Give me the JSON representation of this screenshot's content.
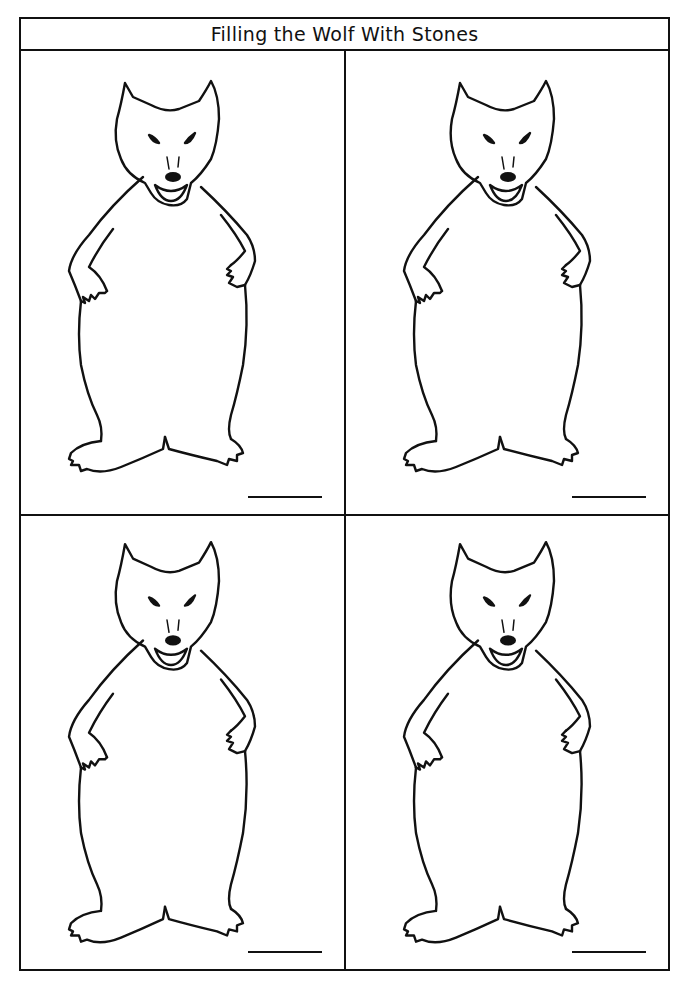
{
  "worksheet": {
    "title": "Filling the Wolf With Stones",
    "panels": [
      {
        "figure": "wolf-outline",
        "answer_blank": ""
      },
      {
        "figure": "wolf-outline",
        "answer_blank": ""
      },
      {
        "figure": "wolf-outline",
        "answer_blank": ""
      },
      {
        "figure": "wolf-outline",
        "answer_blank": ""
      }
    ],
    "colors": {
      "ink": "#111111",
      "paper": "#ffffff"
    }
  }
}
